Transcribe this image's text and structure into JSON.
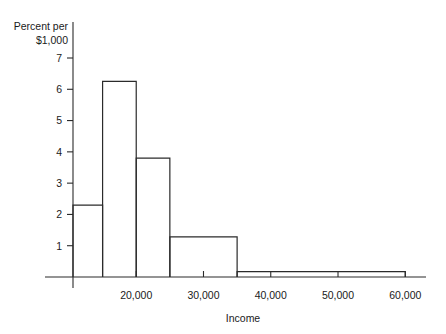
{
  "chart_data": {
    "type": "bar",
    "title": "",
    "subtitle": "",
    "xlabel": "Income",
    "ylabel_line1": "Percent per",
    "ylabel_line2": "$1,000",
    "grid": false,
    "legend": null,
    "xlim": [
      10600,
      61000
    ],
    "ylim": [
      0,
      7.4
    ],
    "x_ticks": [
      20000,
      30000,
      40000,
      50000,
      60000
    ],
    "x_tick_labels": [
      "20,000",
      "30,000",
      "40,000",
      "50,000",
      "60,000"
    ],
    "y_ticks": [
      1,
      2,
      3,
      4,
      5,
      6,
      7
    ],
    "y_tick_labels": [
      "1",
      "2",
      "3",
      "4",
      "5",
      "6",
      "7"
    ],
    "bins": [
      {
        "x0": 10600,
        "x1": 15000,
        "height": 2.3,
        "label": "10,600-15,000"
      },
      {
        "x0": 15000,
        "x1": 20000,
        "height": 6.25,
        "label": "15,000-20,000"
      },
      {
        "x0": 20000,
        "x1": 25000,
        "height": 3.8,
        "label": "20,000-25,000"
      },
      {
        "x0": 25000,
        "x1": 35000,
        "height": 1.28,
        "label": "25,000-35,000"
      },
      {
        "x0": 35000,
        "x1": 60000,
        "height": 0.17,
        "label": "35,000-60,000"
      }
    ],
    "colors": {
      "bar_stroke": "#2b2b2b",
      "bar_fill": "#ffffff",
      "axis": "#2b2b2b",
      "text": "#1a1a1a",
      "background": "#ffffff"
    }
  },
  "geometry": {
    "plot_left": 73,
    "plot_right": 412,
    "plot_baseline": 277,
    "plot_top": 58,
    "axis_overshoot_left": 28,
    "axis_overshoot_right": 14,
    "axis_overshoot_top": 36,
    "axis_overshoot_bottom": 11,
    "y_tick_len": 6,
    "x_tick_len": 6
  }
}
